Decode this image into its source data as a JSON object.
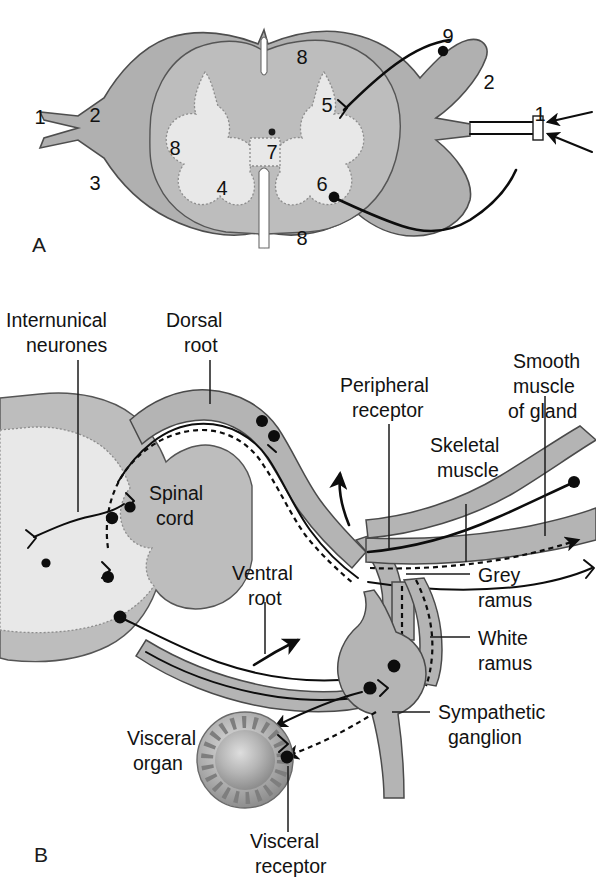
{
  "figure": {
    "panels": [
      {
        "letter": "A",
        "name": "spinal-cord-cross-section"
      },
      {
        "letter": "B",
        "name": "reflex-arc-diagram"
      }
    ]
  },
  "panel_a": {
    "letter": "A",
    "numbered_labels": [
      {
        "n": "1",
        "x": 40,
        "y": 117
      },
      {
        "n": "2",
        "x": 95,
        "y": 115
      },
      {
        "n": "3",
        "x": 95,
        "y": 183
      },
      {
        "n": "8",
        "x": 175,
        "y": 148
      },
      {
        "n": "8",
        "x": 302,
        "y": 57
      },
      {
        "n": "8",
        "x": 302,
        "y": 238
      },
      {
        "n": "4",
        "x": 222,
        "y": 188
      },
      {
        "n": "7",
        "x": 276,
        "y": 152
      },
      {
        "n": "5",
        "x": 327,
        "y": 105
      },
      {
        "n": "6",
        "x": 322,
        "y": 184
      },
      {
        "n": "9",
        "x": 448,
        "y": 36
      },
      {
        "n": "2",
        "x": 489,
        "y": 82
      },
      {
        "n": "1",
        "x": 540,
        "y": 114
      }
    ]
  },
  "panel_b": {
    "letter": "B",
    "text_labels": [
      {
        "id": "internuncial-neurones",
        "lines": [
          "Internunical",
          "neurones"
        ],
        "x": 6,
        "y": 327,
        "align": "start"
      },
      {
        "id": "dorsal-root",
        "lines": [
          "Dorsal",
          "root"
        ],
        "x": 139,
        "y": 327,
        "align": "start"
      },
      {
        "id": "spinal-cord",
        "lines": [
          "Spinal",
          "cord"
        ],
        "x": 149,
        "y": 500,
        "align": "start"
      },
      {
        "id": "ventral-root",
        "lines": [
          "Ventral",
          "root"
        ],
        "x": 232,
        "y": 580,
        "align": "start"
      },
      {
        "id": "peripheral-receptor",
        "lines": [
          "Peripheral",
          "receptor"
        ],
        "x": 340,
        "y": 392,
        "align": "start"
      },
      {
        "id": "smooth-muscle-of-gland",
        "lines": [
          "Smooth",
          "muscle",
          "of gland"
        ],
        "x": 508,
        "y": 362,
        "align": "start"
      },
      {
        "id": "skeletal-muscle",
        "lines": [
          "Skeletal",
          "muscle"
        ],
        "x": 428,
        "y": 475,
        "align": "start"
      },
      {
        "id": "grey-ramus",
        "lines": [
          "Grey",
          "ramus"
        ],
        "x": 478,
        "y": 582,
        "align": "start"
      },
      {
        "id": "white-ramus",
        "lines": [
          "White",
          "ramus"
        ],
        "x": 478,
        "y": 645,
        "align": "start"
      },
      {
        "id": "sympathetic-ganglion",
        "lines": [
          "Sympathetic",
          "ganglion"
        ],
        "x": 438,
        "y": 719,
        "align": "start"
      },
      {
        "id": "visceral-organ",
        "lines": [
          "Visceral",
          "organ"
        ],
        "x": 127,
        "y": 760,
        "align": "start"
      },
      {
        "id": "visceral-receptor",
        "lines": [
          "Visceral",
          "receptor"
        ],
        "x": 250,
        "y": 848,
        "align": "start"
      }
    ]
  },
  "colors": {
    "outer_mater": "#b0b0b0",
    "white_matter": "#bdbdbd",
    "grey_matter": "#e8e8e8",
    "nerve_sheath": "#b4b4b4",
    "ink": "#0d0d0d",
    "background": "#ffffff"
  }
}
